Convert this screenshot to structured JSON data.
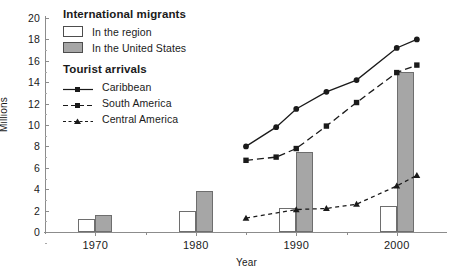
{
  "chart_data": {
    "type": "line",
    "title": "",
    "xlabel": "Year",
    "ylabel": "Millions",
    "xlim": [
      1965,
      2005
    ],
    "ylim": [
      0,
      20
    ],
    "grid": false,
    "legend_position": "upper-left-inside",
    "x_ticks": [
      1970,
      1980,
      1990,
      2000
    ],
    "y_ticks": [
      0,
      2,
      4,
      6,
      8,
      10,
      12,
      14,
      16,
      18,
      20
    ],
    "bar_series": [
      {
        "name": "In the region",
        "style": "white-fill",
        "categories": [
          1970,
          1980,
          1990,
          2000
        ],
        "values": [
          1.2,
          2.0,
          2.2,
          2.4
        ]
      },
      {
        "name": "In the United States",
        "style": "grey-fill",
        "categories": [
          1970,
          1980,
          1990,
          2000
        ],
        "values": [
          1.6,
          3.8,
          7.5,
          15.0
        ]
      }
    ],
    "line_series": [
      {
        "name": "Caribbean",
        "linestyle": "solid",
        "marker": "circle",
        "x": [
          1985,
          1988,
          1990,
          1993,
          1996,
          2000,
          2002
        ],
        "values": [
          8.0,
          9.8,
          11.5,
          13.1,
          14.2,
          17.2,
          18.0
        ]
      },
      {
        "name": "South America",
        "linestyle": "dashed",
        "marker": "square",
        "x": [
          1985,
          1988,
          1990,
          1993,
          1996,
          2000,
          2002
        ],
        "values": [
          6.7,
          7.0,
          7.8,
          9.9,
          12.1,
          14.9,
          15.6
        ]
      },
      {
        "name": "Central America",
        "linestyle": "dotted-dashed",
        "marker": "triangle",
        "x": [
          1985,
          1990,
          1993,
          1996,
          2000,
          2002
        ],
        "values": [
          1.3,
          2.1,
          2.2,
          2.6,
          4.3,
          5.3
        ]
      }
    ]
  },
  "axes": {
    "y_title": "Millions",
    "x_title": "Year",
    "y_tick_labels": [
      "20",
      "18",
      "16",
      "14",
      "12",
      "10",
      "8",
      "6",
      "4",
      "2",
      "0"
    ],
    "x_tick_labels": [
      "1970",
      "1980",
      "1990",
      "2000"
    ]
  },
  "legend": {
    "migrants": {
      "title": "International migrants",
      "items": [
        {
          "label": "In the region",
          "swatch": "white-square-swatch"
        },
        {
          "label": "In the United States",
          "swatch": "grey-square-swatch"
        }
      ]
    },
    "tourist": {
      "title": "Tourist arrivals",
      "items": [
        {
          "label": "Caribbean",
          "swatch": "solid-line-circle-marker-swatch"
        },
        {
          "label": "South America",
          "swatch": "dashed-line-square-marker-swatch"
        },
        {
          "label": "Central America",
          "swatch": "dashed-line-triangle-marker-swatch"
        }
      ]
    }
  },
  "colors": {
    "bar_region_fill": "#ffffff",
    "bar_us_fill": "#a6a6a6",
    "bar_stroke": "#6e6e6e",
    "line": "#1a1a1a",
    "axis": "#8c8c8c",
    "text": "#1a1a1a",
    "background": "#ffffff"
  }
}
